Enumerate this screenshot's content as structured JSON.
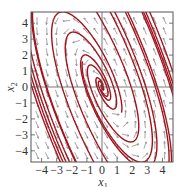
{
  "figure": {
    "type": "phase-portrait",
    "xlabel": "x",
    "xlabel_sub": "1",
    "ylabel": "x",
    "ylabel_sub": "2",
    "xlim": [
      -4.7,
      4.7
    ],
    "ylim": [
      -4.7,
      4.7
    ],
    "xticks": [
      -4,
      -3,
      -2,
      -1,
      0,
      1,
      2,
      3,
      4
    ],
    "yticks": [
      -4,
      -3,
      -2,
      -1,
      0,
      1,
      2,
      3,
      4
    ],
    "xtick_labels": [
      "−4",
      "−3",
      "−2",
      "−1",
      "0",
      "1",
      "2",
      "3",
      "4"
    ],
    "ytick_labels": [
      "−4",
      "−3",
      "−2",
      "−1",
      "0",
      "1",
      "2",
      "3",
      "4"
    ],
    "colors": {
      "trajectory": "#a3121c",
      "arrow": "#666666",
      "axis": "#555555",
      "frame": "#555555"
    },
    "plot_box": {
      "left": 31,
      "top": 12,
      "right": 173,
      "bottom": 162
    }
  }
}
